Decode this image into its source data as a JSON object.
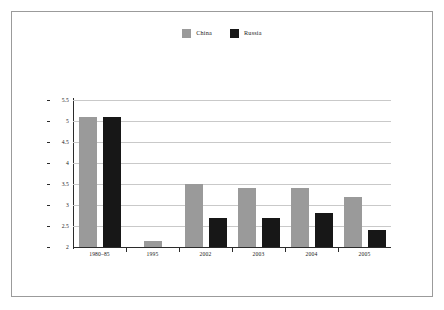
{
  "figure": {
    "border_color": "#9b9b9b",
    "background": "#ffffff"
  },
  "legend": {
    "position": "top-center",
    "entries": [
      {
        "label": "China",
        "color": "#9a9a9a"
      },
      {
        "label": "Russia",
        "color": "#171717"
      }
    ]
  },
  "chart_data": {
    "type": "bar",
    "title": "",
    "subtitle": "",
    "xlabel": "",
    "ylabel": "",
    "categories": [
      "1980–85",
      "1995",
      "2002",
      "2003",
      "2004",
      "2005"
    ],
    "series": [
      {
        "name": "China",
        "color": "#9a9a9a",
        "values": [
          5.1,
          2.15,
          3.5,
          3.4,
          3.4,
          3.2
        ]
      },
      {
        "name": "Russia",
        "color": "#171717",
        "values": [
          5.1,
          null,
          2.7,
          2.7,
          2.8,
          2.4
        ]
      }
    ],
    "ylim": [
      2,
      5.5
    ],
    "yticks": [
      2,
      2.5,
      3,
      3.5,
      4,
      4.5,
      5,
      5.5
    ],
    "ytick_labels": [
      "2",
      "2.5",
      "3",
      "3.5",
      "4",
      "4.5",
      "5",
      "5.5"
    ],
    "grid": true,
    "grid_axis": "y",
    "grid_color": "#c9c9c9",
    "legend_position": "top-center",
    "axis_color": "#2b2b2b"
  }
}
